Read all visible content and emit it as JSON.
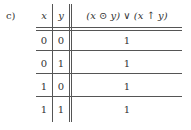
{
  "part_label": "c)",
  "table": {
    "headers": [
      "x",
      "y",
      "(x ⊙ y) ∨ (x ↑ y)"
    ],
    "rows": [
      [
        "0",
        "0",
        "1"
      ],
      [
        "0",
        "1",
        "1"
      ],
      [
        "1",
        "0",
        "1"
      ],
      [
        "1",
        "1",
        "1"
      ]
    ]
  }
}
